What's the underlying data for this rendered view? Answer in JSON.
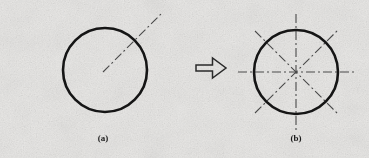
{
  "document": {
    "kind": "engineering-drawing-figure",
    "caption_style": "parenthesized-letters",
    "background_color": "#e9e8e6",
    "ink_color": "#151515",
    "centerline_color": "#4a4a4a"
  },
  "figures": [
    {
      "id": "a",
      "label": "(a)",
      "label_x": 103,
      "label_y": 133,
      "description": "circle with single inclined centre line",
      "circle": {
        "cx": 105,
        "cy": 70,
        "r": 42,
        "stroke_width": 2.6
      },
      "center_lines": [
        {
          "name": "diagonal-up-right",
          "angle_deg": -45,
          "x1": 103,
          "y1": 72,
          "x2": 163,
          "y2": 12
        }
      ]
    },
    {
      "id": "b",
      "label": "(b)",
      "label_x": 296,
      "label_y": 133,
      "description": "circle with four centre lines at 45 degree intervals",
      "circle": {
        "cx": 296,
        "cy": 72,
        "r": 42,
        "stroke_width": 2.6
      },
      "center_lines": [
        {
          "name": "vertical",
          "angle_deg": 90,
          "x1": 296,
          "y1": 14,
          "x2": 296,
          "y2": 130
        },
        {
          "name": "horizontal",
          "angle_deg": 0,
          "x1": 238,
          "y1": 72,
          "x2": 355,
          "y2": 72
        },
        {
          "name": "diagonal-up-right",
          "angle_deg": -45,
          "x1": 255,
          "y1": 113,
          "x2": 337,
          "y2": 31
        },
        {
          "name": "diagonal-down-right",
          "angle_deg": 45,
          "x1": 255,
          "y1": 31,
          "x2": 337,
          "y2": 113
        }
      ]
    }
  ],
  "arrow": {
    "name": "transform-arrow",
    "direction": "right",
    "style": "hollow-outline",
    "x": 196,
    "y": 58,
    "width": 30,
    "height": 20
  },
  "centerline_dash_pattern": "9 3 2 3",
  "centerline_width": 1.1
}
